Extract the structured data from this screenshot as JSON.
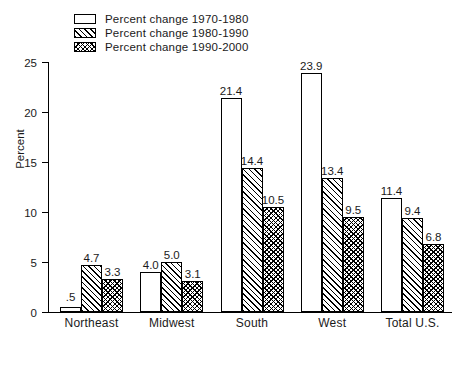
{
  "chart_data": {
    "type": "bar",
    "title": "",
    "xlabel": "",
    "ylabel": "Percent",
    "ylim": [
      0,
      25
    ],
    "yticks": [
      0,
      5,
      10,
      15,
      20,
      25
    ],
    "grid": false,
    "legend_position": "top-left",
    "categories": [
      "Northeast",
      "Midwest",
      "South",
      "West",
      "Total U.S."
    ],
    "series": [
      {
        "name": "Percent change 1970-1980",
        "pattern": "plain",
        "values": [
          0.5,
          4.0,
          21.4,
          23.9,
          11.4
        ],
        "labels": [
          ".5",
          "4.0",
          "21.4",
          "23.9",
          "11.4"
        ]
      },
      {
        "name": "Percent change 1980-1990",
        "pattern": "diagonal-hatch",
        "values": [
          4.7,
          5.0,
          14.4,
          13.4,
          9.4
        ],
        "labels": [
          "4.7",
          "5.0",
          "14.4",
          "13.4",
          "9.4"
        ]
      },
      {
        "name": "Percent change 1990-2000",
        "pattern": "crosshatch",
        "values": [
          3.3,
          3.1,
          10.5,
          9.5,
          6.8
        ],
        "labels": [
          "3.3",
          "3.1",
          "10.5",
          "9.5",
          "6.8"
        ]
      }
    ]
  },
  "colors": {
    "ink": "#000000",
    "background": "#ffffff"
  }
}
